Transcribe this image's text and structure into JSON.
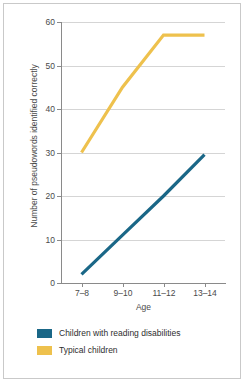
{
  "chart_data": {
    "type": "line",
    "title": "",
    "subtitle": "",
    "xlabel": "Age",
    "ylabel": "Number of pseudowords identified correctly",
    "categories": [
      "7–8",
      "9–10",
      "11–12",
      "13–14"
    ],
    "ylim": [
      0,
      60
    ],
    "yticks": [
      0,
      10,
      20,
      30,
      40,
      50,
      60
    ],
    "ytick_labels": [
      "0",
      "10",
      "20",
      "30",
      "40",
      "50",
      "60"
    ],
    "grid": "horizontal",
    "legend_position": "bottom-left",
    "series": [
      {
        "name": "Children with reading disabilities",
        "color": "#1a6787",
        "values": [
          2,
          11,
          20,
          29.5
        ]
      },
      {
        "name": "Typical children",
        "color": "#eec14d",
        "values": [
          30,
          45,
          57,
          57
        ]
      }
    ]
  },
  "axes": {
    "x_title": "Age",
    "y_title": "Number of pseudowords identified correctly",
    "x_tick_labels": [
      "7–8",
      "9–10",
      "11–12",
      "13–14"
    ],
    "y_tick_labels": [
      "0",
      "10",
      "20",
      "30",
      "40",
      "50",
      "60"
    ]
  },
  "legend": {
    "items": [
      {
        "label": "Children with reading disabilities",
        "color": "#1a6787"
      },
      {
        "label": "Typical children",
        "color": "#eec14d"
      }
    ]
  },
  "colors": {
    "series_blue": "#1a6787",
    "series_yellow": "#eec14d",
    "grid": "#d5d5d5",
    "axis": "#8a8a8a",
    "frame": "#c9c9c9",
    "background": "#ffffff",
    "text": "#4a4a4a"
  }
}
